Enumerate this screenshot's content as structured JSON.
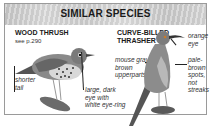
{
  "header": {
    "title": "SIMILAR SPECIES"
  },
  "species": [
    {
      "name": "WOOD THRUSH",
      "reference": "see p.290",
      "notes": [
        "shorter tail",
        "large, dark eye with white eye-ring"
      ]
    },
    {
      "name_line1": "CURVE-BILLED",
      "name_line2": "THRASHER",
      "notes": [
        "mouse gray-brown upperparts",
        "orange eye",
        "pale-brown spots, not streaks"
      ]
    }
  ],
  "notes_display": {
    "shorter_1": "shorter",
    "shorter_2": "tail",
    "eye_1": "large, dark",
    "eye_2": "eye with",
    "eye_3": "white eye-ring",
    "mouse_1": "mouse gray-",
    "mouse_2": "brown",
    "mouse_3": "upperparts",
    "orange_1": "orange",
    "orange_2": "eye",
    "pale_1": "pale-",
    "pale_2": "brown",
    "pale_3": "spots,",
    "pale_4": "not",
    "pale_5": "streaks"
  },
  "colors": {
    "header_bg": "#d4d4d4",
    "border": "#9a9a9a",
    "text": "#1a1a1a"
  }
}
